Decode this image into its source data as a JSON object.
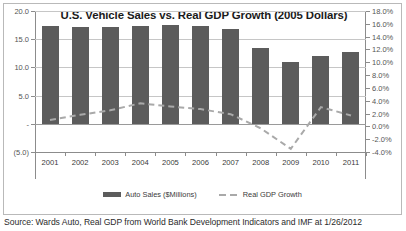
{
  "chart": {
    "title": "U.S. Vehicle Sales vs. Real GDP Growth (2005 Dollars)",
    "source_note": "Source: Wards Auto, Real GDP from World Bank Development Indicators and IMF at 1/26/2012",
    "legend": [
      {
        "label": "Auto Sales ($Millions)",
        "marker": "bar-swatch",
        "color": "#5c5c5c"
      },
      {
        "label": "Real GDP Growth",
        "marker": "dashed-line-swatch",
        "color": "#a9a9a9"
      }
    ]
  },
  "chart_data": {
    "type": "bar",
    "title": "U.S. Vehicle Sales vs. Real GDP Growth (2005 Dollars)",
    "xlabel": "",
    "ylabel": "",
    "grid": true,
    "legend_position": "bottom",
    "categories": [
      "2001",
      "2002",
      "2003",
      "2004",
      "2005",
      "2006",
      "2007",
      "2008",
      "2009",
      "2010",
      "2011"
    ],
    "series": [
      {
        "name": "Auto Sales ($Millions)",
        "type": "bar",
        "axis": "left",
        "color": "#5c5c5c",
        "values": [
          17.4,
          17.1,
          17.1,
          17.3,
          17.5,
          17.3,
          16.8,
          13.4,
          10.9,
          12.0,
          12.8
        ]
      },
      {
        "name": "Real GDP Growth",
        "type": "line",
        "style": "dashed",
        "axis": "right",
        "color": "#a9a9a9",
        "values": [
          1.0,
          1.8,
          2.5,
          3.6,
          3.1,
          2.7,
          1.9,
          -0.3,
          -3.5,
          3.0,
          1.7
        ]
      }
    ],
    "left_axis": {
      "label": "",
      "ylim": [
        -5.0,
        20.0
      ],
      "tick_values": [
        20.0,
        15.0,
        10.0,
        5.0,
        0.0,
        -5.0
      ],
      "tick_labels": [
        "20.0",
        "15.0",
        "10.0",
        "5.0",
        "-",
        "(5.0)"
      ]
    },
    "right_axis": {
      "label": "",
      "ylim": [
        -4.0,
        18.0
      ],
      "tick_values": [
        18.0,
        16.0,
        14.0,
        12.0,
        10.0,
        8.0,
        6.0,
        4.0,
        2.0,
        0.0,
        -2.0,
        -4.0
      ],
      "tick_labels": [
        "18.0%",
        "16.0%",
        "14.0%",
        "12.0%",
        "10.0%",
        "8.0%",
        "6.0%",
        "4.0%",
        "2.0%",
        "0.0%",
        "-2.0%",
        "-4.0%"
      ]
    }
  }
}
